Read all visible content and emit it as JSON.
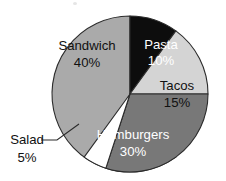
{
  "chart_data": {
    "type": "pie",
    "title": "",
    "subtitle": "",
    "xlabel": "",
    "ylabel": "",
    "legend_position": "none",
    "grid": false,
    "categories": [
      "Sandwich",
      "Pasta",
      "Tacos",
      "Hamburgers",
      "Salad"
    ],
    "values": [
      40,
      10,
      15,
      30,
      5
    ],
    "value_unit": "%",
    "slices": [
      {
        "label": "Sandwich",
        "value": 40,
        "value_text": "40%",
        "color": "#aaaaaa",
        "text_color": "#111111",
        "label_placement": "inside",
        "start_angle": 144,
        "end_angle": 360
      },
      {
        "label": "Pasta",
        "value": 10,
        "value_text": "10%",
        "color": "#0d0d0d",
        "text_color": "#ffffff",
        "label_placement": "inside",
        "start_angle": 0,
        "end_angle": 36
      },
      {
        "label": "Tacos",
        "value": 15,
        "value_text": "15%",
        "color": "#d4d4d4",
        "text_color": "#111111",
        "label_placement": "inside",
        "start_angle": 36,
        "end_angle": 90
      },
      {
        "label": "Hamburgers",
        "value": 30,
        "value_text": "30%",
        "color": "#787878",
        "text_color": "#ffffff",
        "label_placement": "inside",
        "start_angle": 90,
        "end_angle": 198
      },
      {
        "label": "Salad",
        "value": 5,
        "value_text": "5%",
        "color": "#ffffff",
        "text_color": "#111111",
        "label_placement": "outside-leader",
        "start_angle": 198,
        "end_angle": 216
      }
    ],
    "outline_color": "#2b2b2b",
    "background": "#ffffff"
  }
}
